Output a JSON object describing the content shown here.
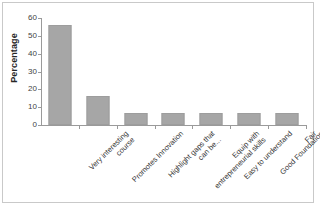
{
  "chart_data": {
    "type": "bar",
    "title": "",
    "xlabel": "",
    "ylabel": "Percentage",
    "ylim": [
      0,
      60
    ],
    "ytick_values": [
      60,
      50,
      40,
      30,
      20,
      10,
      0
    ],
    "ytick_labels": [
      "60",
      "50",
      "40",
      "30",
      "20",
      "10",
      "0"
    ],
    "grid": false,
    "legend": false,
    "bar_color": "#a6a6a6",
    "axis_color": "#9a9a9a",
    "categories": [
      "Very interesting course",
      "Promotes Innovation",
      "Highlight gaps that can be...",
      "Equip with entrepreneurial skills",
      "Easy to understand",
      "Good Foundation",
      "Fair"
    ],
    "category_lines": [
      [
        "Very interesting",
        "course"
      ],
      [
        "Promotes Innovation",
        ""
      ],
      [
        "Highlight gaps that",
        "can be..."
      ],
      [
        "Equip with",
        "entrepreneurial skills"
      ],
      [
        "Easy to understand",
        ""
      ],
      [
        "Good Foundation",
        ""
      ],
      [
        "Fair",
        ""
      ]
    ],
    "values": [
      56,
      16.5,
      7,
      7,
      7,
      7,
      7
    ]
  },
  "axis": {
    "y_title": "Percentage"
  }
}
